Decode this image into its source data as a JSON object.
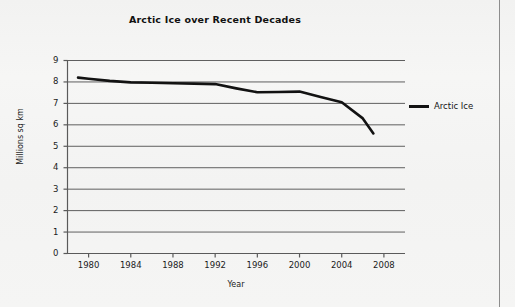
{
  "chart_data": {
    "type": "line",
    "title": "Arctic Ice over Recent Decades",
    "xlabel": "Year",
    "ylabel": "Millions sq km",
    "x": [
      1979,
      1980,
      1982,
      1984,
      1986,
      1988,
      1990,
      1992,
      1994,
      1996,
      1998,
      2000,
      2002,
      2004,
      2006,
      2007
    ],
    "series": [
      {
        "name": "Arctic Ice",
        "color": "#121212",
        "values": [
          8.2,
          8.15,
          8.05,
          7.98,
          7.96,
          7.94,
          7.92,
          7.9,
          7.7,
          7.52,
          7.53,
          7.55,
          7.3,
          7.05,
          6.3,
          5.6
        ]
      }
    ],
    "xlim": [
      1978,
      2010
    ],
    "ylim": [
      0,
      9
    ],
    "xticks": [
      1980,
      1984,
      1988,
      1992,
      1996,
      2000,
      2004,
      2008
    ],
    "yticks": [
      0,
      1,
      2,
      3,
      4,
      5,
      6,
      7,
      8,
      9
    ],
    "xtick_labels": [
      "1980",
      "1984",
      "1988",
      "1992",
      "1996",
      "2000",
      "2004",
      "2008"
    ],
    "ytick_labels": [
      "0",
      "1",
      "2",
      "3",
      "4",
      "5",
      "6",
      "7",
      "8",
      "9"
    ],
    "grid": "horizontal",
    "legend": {
      "position": "right",
      "entries": [
        {
          "label": "Arctic Ice",
          "color": "#121212"
        }
      ]
    },
    "axis_color": "#5a5a5a",
    "grid_color": "#5f5f5f",
    "background": "#f4f4f3"
  }
}
